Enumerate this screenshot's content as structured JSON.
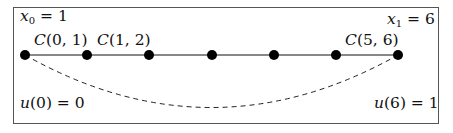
{
  "labels": {
    "x0": {
      "var": "x",
      "sub": "0",
      "rest": " = 1"
    },
    "x1": {
      "var": "x",
      "sub": "1",
      "rest": " = 6"
    },
    "c01": {
      "fn": "C",
      "args": "(0, 1)"
    },
    "c12": {
      "fn": "C",
      "args": "(1, 2)"
    },
    "c56": {
      "fn": "C",
      "args": "(5, 6)"
    },
    "u0": {
      "fn": "u",
      "args": "(0) = 0"
    },
    "u6": {
      "fn": "u",
      "args": "(6) = 1"
    }
  },
  "nodes": [
    {
      "x": 25,
      "y": 55
    },
    {
      "x": 87,
      "y": 55
    },
    {
      "x": 149,
      "y": 55
    },
    {
      "x": 212,
      "y": 55
    },
    {
      "x": 274,
      "y": 55
    },
    {
      "x": 336,
      "y": 55
    },
    {
      "x": 398,
      "y": 55
    }
  ],
  "colors": {
    "line": "#111111",
    "node": "#000000",
    "frame": "#555555",
    "dashed": "#222222"
  }
}
